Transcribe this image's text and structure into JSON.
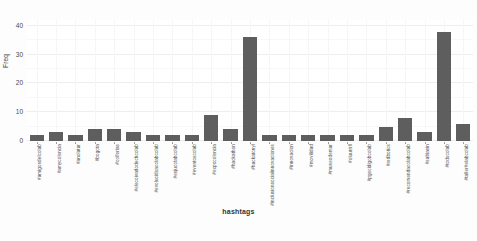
{
  "chart_data": {
    "type": "bar",
    "title": "",
    "xlabel": "hashtags",
    "ylabel": "Freq",
    "ylim": [
      0,
      42
    ],
    "yticks": [
      0,
      10,
      20,
      30,
      40
    ],
    "grid": true,
    "legend": "none",
    "bar_color": "#5e5e5e",
    "background_color": "#ffffff",
    "categories": [
      "#amigosdelcolab",
      "#amycolencia",
      "#anolatur",
      "#bogota",
      "#colferias",
      "#elecoivadodechcolab",
      "#evolucidoacolabcolab",
      "#esjucolabcolab",
      "#eventoscolab",
      "#expocolencia",
      "#hackathon",
      "#hackatonyl",
      "#inclusionsocialinnovaciones",
      "#innovacion",
      "#movilidad",
      "#museodemar",
      "#oluurrrll",
      "#pgecidigobcolab",
      "#redbotics",
      "#recomendacolabcolab",
      "#sabiasin",
      "#todocolab",
      "#taller#elabcolab"
    ],
    "values": [
      2,
      3,
      2,
      4,
      4,
      3,
      2,
      2,
      2,
      9,
      4,
      36,
      2,
      2,
      2,
      2,
      2,
      2,
      5,
      8,
      3,
      38,
      6
    ]
  },
  "axis": {
    "y_title": "Freq",
    "x_title": "hashtags"
  }
}
